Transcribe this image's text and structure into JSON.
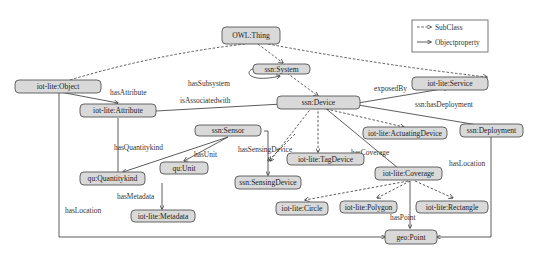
{
  "diagram": {
    "type": "ontology-graph",
    "legend": {
      "subclass": "SubClass",
      "objectproperty": "Objectproperty"
    },
    "nodes": {
      "owl_thing": "OWL:Thing",
      "ssn_system": "ssn:System",
      "iot_object": "iot-lite:Object",
      "iot_attribute": "iot-lite:Attribute",
      "ssn_device": "ssn:Device",
      "iot_service": "iot-lite:Service",
      "ssn_deployment": "ssn:Deployment",
      "ssn_sensor": "ssn:Sensor",
      "iot_actuating": "iot-lite:ActuatingDevice",
      "qu_quantitykind": "qu:Quantitykind",
      "qu_unit": "qu:Unit",
      "iot_tagdevice": "iot-lite:TagDevice",
      "ssn_sensingdevice": "ssn:SensingDevice",
      "iot_coverage": "iot-lite:Coverage",
      "iot_metadata": "iot-lite:Metadata",
      "iot_circle": "iot-lite:Circle",
      "iot_polygon": "iot-lite:Polygon",
      "iot_rectangle": "iot-lite:Rectangle",
      "geo_point": "geo:Point"
    },
    "edge_labels": {
      "hasSubsystem": "hasSubsystem",
      "hasAttribute": "hasAttribute",
      "isAssociatedwith": "isAssociatedwith",
      "exposedBy": "exposedBy",
      "hasDeployment": "ssn:hasDeployment",
      "hasQuantitykind": "hasQuantitykind",
      "hasUnit": "hasUnit",
      "hasSensingDevice": "hasSensingDevice",
      "hasCoverage": "hasCoverage",
      "hasMetadata": "hasMetadata",
      "hasLocation_left": "hasLocation",
      "hasLocation_right": "hasLocation",
      "hasPoint": "hasPoint"
    }
  }
}
